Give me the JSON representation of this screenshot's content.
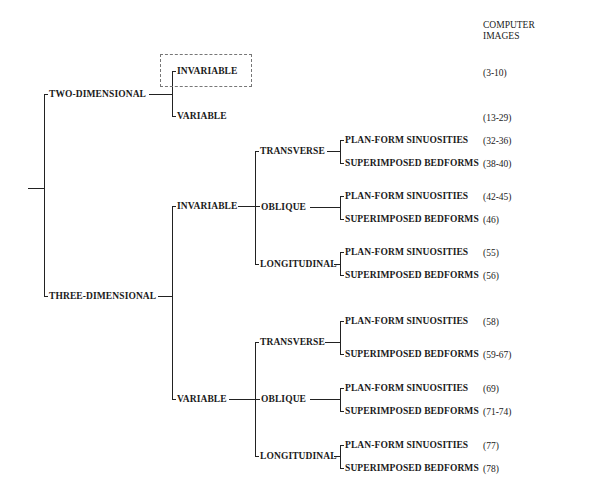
{
  "header": {
    "line1": "COMPUTER",
    "line2": "IMAGES"
  },
  "tree": {
    "two_dimensional": {
      "label": "TWO-DIMENSIONAL",
      "invariable": {
        "label": "INVARIABLE",
        "images": "(3-10)",
        "highlighted": true
      },
      "variable": {
        "label": "VARIABLE",
        "images": "(13-29)"
      }
    },
    "three_dimensional": {
      "label": "THREE-DIMENSIONAL",
      "invariable": {
        "label": "INVARIABLE",
        "transverse": {
          "label": "TRANSVERSE",
          "planform": {
            "label": "PLAN-FORM SINUOSITIES",
            "images": "(32-36)"
          },
          "bedforms": {
            "label": "SUPERIMPOSED BEDFORMS",
            "images": "(38-40)"
          }
        },
        "oblique": {
          "label": "OBLIQUE",
          "planform": {
            "label": "PLAN-FORM SINUOSITIES",
            "images": "(42-45)"
          },
          "bedforms": {
            "label": "SUPERIMPOSED BEDFORMS",
            "images": "(46)"
          }
        },
        "longitudinal": {
          "label": "LONGITUDINAL",
          "planform": {
            "label": "PLAN-FORM SINUOSITIES",
            "images": "(55)"
          },
          "bedforms": {
            "label": "SUPERIMPOSED BEDFORMS",
            "images": "(56)"
          }
        }
      },
      "variable": {
        "label": "VARIABLE",
        "transverse": {
          "label": "TRANSVERSE",
          "planform": {
            "label": "PLAN-FORM SINUOSITIES",
            "images": "(58)"
          },
          "bedforms": {
            "label": "SUPERIMPOSED BEDFORMS",
            "images": "(59-67)"
          }
        },
        "oblique": {
          "label": "OBLIQUE",
          "planform": {
            "label": "PLAN-FORM SINUOSITIES",
            "images": "(69)"
          },
          "bedforms": {
            "label": "SUPERIMPOSED BEDFORMS",
            "images": "(71-74)"
          }
        },
        "longitudinal": {
          "label": "LONGITUDINAL",
          "planform": {
            "label": "PLAN-FORM SINUOSITIES",
            "images": "(77)"
          },
          "bedforms": {
            "label": "SUPERIMPOSED BEDFORMS",
            "images": "(78)"
          }
        }
      }
    }
  }
}
